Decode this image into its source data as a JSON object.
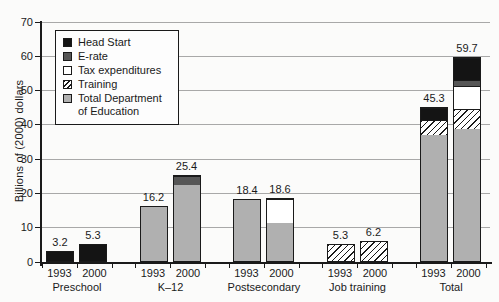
{
  "chart_data": {
    "type": "bar",
    "stacked": true,
    "title": "",
    "xlabel": "",
    "ylabel": "Billions of (2000) dollars",
    "ylim": [
      0,
      70
    ],
    "yticks": [
      0,
      10,
      20,
      30,
      40,
      50,
      60,
      70
    ],
    "grid": true,
    "legend_position": "upper-left",
    "colors": {
      "head_start": "#141414",
      "e_rate": "#565656",
      "tax_expenditures": "#ffffff",
      "training": "hatched-white",
      "education": "#b0b0b0",
      "gridline": "#a8a8a8",
      "ink": "#1a1a1a"
    },
    "legend": [
      {
        "label": "Head Start",
        "key": "head_start",
        "style": "black"
      },
      {
        "label": "E-rate",
        "key": "e_rate",
        "style": "darkgray"
      },
      {
        "label": "Tax expenditures",
        "key": "tax_expenditures",
        "style": "white"
      },
      {
        "label": "Training",
        "key": "training",
        "style": "hatch"
      },
      {
        "label": "Total Department of Education",
        "key": "education",
        "style": "gray"
      }
    ],
    "series_styles": {
      "head_start": "black",
      "e_rate": "darkgray",
      "tax_expenditures": "white",
      "training": "hatch",
      "education": "gray"
    },
    "groups": [
      {
        "label": "Preschool",
        "bars": [
          {
            "year": "1993",
            "total": 3.2,
            "total_label": "3.2",
            "segments": [
              {
                "key": "head_start",
                "value": 3.2
              }
            ]
          },
          {
            "year": "2000",
            "total": 5.3,
            "total_label": "5.3",
            "segments": [
              {
                "key": "head_start",
                "value": 5.3
              }
            ]
          }
        ]
      },
      {
        "label": "K–12",
        "bars": [
          {
            "year": "1993",
            "total": 16.2,
            "total_label": "16.2",
            "segments": [
              {
                "key": "education",
                "value": 16.2
              }
            ]
          },
          {
            "year": "2000",
            "total": 25.4,
            "total_label": "25.4",
            "segments": [
              {
                "key": "education",
                "value": 22.8
              },
              {
                "key": "e_rate",
                "value": 2.6
              }
            ]
          }
        ]
      },
      {
        "label": "Postsecondary",
        "bars": [
          {
            "year": "1993",
            "total": 18.4,
            "total_label": "18.4",
            "segments": [
              {
                "key": "education",
                "value": 18.4
              }
            ]
          },
          {
            "year": "2000",
            "total": 18.6,
            "total_label": "18.6",
            "segments": [
              {
                "key": "education",
                "value": 11.3
              },
              {
                "key": "tax_expenditures",
                "value": 7.3
              }
            ]
          }
        ]
      },
      {
        "label": "Job training",
        "bars": [
          {
            "year": "1993",
            "total": 5.3,
            "total_label": "5.3",
            "segments": [
              {
                "key": "training",
                "value": 5.3
              }
            ]
          },
          {
            "year": "2000",
            "total": 6.2,
            "total_label": "6.2",
            "segments": [
              {
                "key": "training",
                "value": 6.2
              }
            ]
          }
        ]
      },
      {
        "label": "Total",
        "bars": [
          {
            "year": "1993",
            "total": 45.3,
            "total_label": "45.3",
            "segments": [
              {
                "key": "education",
                "value": 37.3
              },
              {
                "key": "training",
                "value": 4.5
              },
              {
                "key": "head_start",
                "value": 3.5
              }
            ]
          },
          {
            "year": "2000",
            "total": 59.7,
            "total_label": "59.7",
            "segments": [
              {
                "key": "education",
                "value": 38.8
              },
              {
                "key": "training",
                "value": 6.1
              },
              {
                "key": "tax_expenditures",
                "value": 6.6
              },
              {
                "key": "e_rate",
                "value": 1.9
              },
              {
                "key": "head_start",
                "value": 6.3
              }
            ]
          }
        ]
      }
    ]
  }
}
